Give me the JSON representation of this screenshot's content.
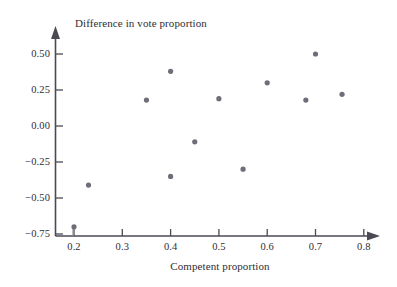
{
  "figure": {
    "background_color": "#ffffff",
    "marker_color": "#6e6e78",
    "axis_color": "#4a4a52",
    "text_color": "#2e2e34"
  },
  "chart_data": {
    "type": "scatter",
    "title": "",
    "xlabel": "Competent proportion",
    "ylabel": "Difference in vote proportion",
    "xlim": [
      0.17,
      0.83
    ],
    "ylim": [
      -0.78,
      0.62
    ],
    "grid": false,
    "legend": null,
    "xticks": [
      0.2,
      0.3,
      0.4,
      0.5,
      0.6,
      0.7,
      0.8
    ],
    "xtick_labels": [
      "0.2",
      "0.3",
      "0.4",
      "0.5",
      "0.6",
      "0.7",
      "0.8"
    ],
    "yticks": [
      0.5,
      0.25,
      0.0,
      -0.25,
      -0.5,
      -0.75
    ],
    "ytick_labels": [
      "0.50",
      "0.25",
      "0.00",
      "−0.25",
      "−0.50",
      "−0.75"
    ],
    "x": [
      0.2,
      0.23,
      0.35,
      0.4,
      0.4,
      0.45,
      0.5,
      0.55,
      0.6,
      0.68,
      0.7,
      0.755
    ],
    "y": [
      -0.7,
      -0.41,
      0.18,
      0.38,
      -0.35,
      -0.11,
      0.19,
      -0.3,
      0.3,
      0.18,
      0.5,
      0.22
    ],
    "points": [
      {
        "x": 0.2,
        "y": -0.7
      },
      {
        "x": 0.23,
        "y": -0.41
      },
      {
        "x": 0.35,
        "y": 0.18
      },
      {
        "x": 0.4,
        "y": 0.38
      },
      {
        "x": 0.4,
        "y": -0.35
      },
      {
        "x": 0.45,
        "y": -0.11
      },
      {
        "x": 0.5,
        "y": 0.19
      },
      {
        "x": 0.55,
        "y": -0.3
      },
      {
        "x": 0.6,
        "y": 0.3
      },
      {
        "x": 0.68,
        "y": 0.18
      },
      {
        "x": 0.7,
        "y": 0.5
      },
      {
        "x": 0.755,
        "y": 0.22
      }
    ]
  }
}
